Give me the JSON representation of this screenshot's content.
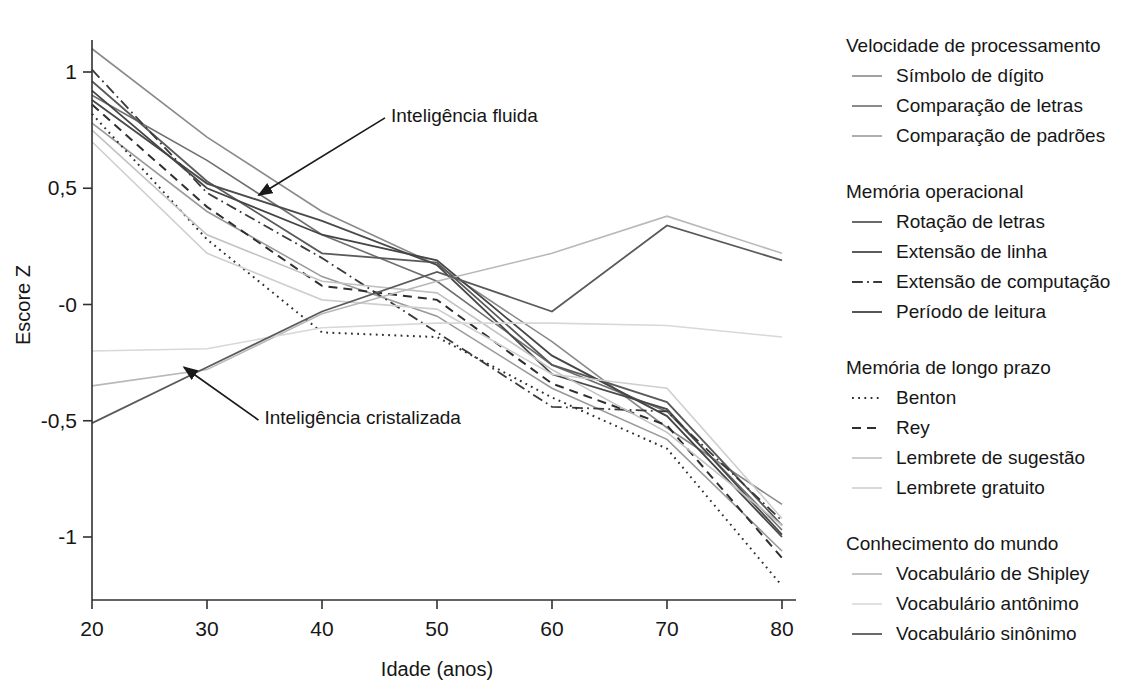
{
  "chart_data": {
    "type": "line",
    "title": "",
    "xlabel": "Idade (anos)",
    "ylabel": "Escore Z",
    "x": [
      20,
      30,
      40,
      50,
      60,
      70,
      80
    ],
    "xlim": [
      20,
      80
    ],
    "ylim": [
      -1.25,
      1.15
    ],
    "xticks": [
      "20",
      "30",
      "40",
      "50",
      "60",
      "70",
      "80"
    ],
    "yticks": [
      "1",
      "0,5",
      "-0",
      "-0,5",
      "-1"
    ],
    "ytick_values": [
      1,
      0.5,
      0,
      -0.5,
      -1
    ],
    "grid": false,
    "legend_position": "right",
    "annotations": [
      {
        "text": "Inteligência fluida",
        "x": 46,
        "y": 0.82,
        "arrow_to_x": 34.5,
        "arrow_to_y": 0.47
      },
      {
        "text": "Inteligência cristalizada",
        "x": 35,
        "y": -0.48,
        "arrow_to_x": 28,
        "arrow_to_y": -0.27
      }
    ],
    "groups": [
      {
        "name": "Velocidade de processamento",
        "series": [
          {
            "name": "Símbolo de dígito",
            "style": "solid",
            "color": "#8a8a8a",
            "width": 1.6,
            "values": [
              1.1,
              0.72,
              0.4,
              0.17,
              -0.16,
              -0.53,
              -0.86
            ]
          },
          {
            "name": "Comparação de letras",
            "style": "solid",
            "color": "#6e6e6e",
            "width": 1.6,
            "values": [
              0.9,
              0.62,
              0.3,
              0.1,
              -0.26,
              -0.46,
              -0.97
            ]
          },
          {
            "name": "Comparação de padrões",
            "style": "solid",
            "color": "#9a9a9a",
            "width": 1.6,
            "values": [
              0.78,
              0.4,
              0.12,
              -0.05,
              -0.36,
              -0.58,
              -1.06
            ]
          }
        ]
      },
      {
        "name": "Memória operacional",
        "series": [
          {
            "name": "Rotação de letras",
            "style": "solid",
            "color": "#5a5a5a",
            "width": 1.8,
            "values": [
              0.96,
              0.53,
              0.22,
              0.18,
              -0.26,
              -0.42,
              -0.95
            ]
          },
          {
            "name": "Extensão de linha",
            "style": "solid",
            "color": "#4a4a4a",
            "width": 1.8,
            "values": [
              0.88,
              0.52,
              0.36,
              0.17,
              -0.3,
              -0.45,
              -0.99
            ]
          },
          {
            "name": "Extensão de computação",
            "style": "dashdot",
            "color": "#3a3a3a",
            "width": 1.8,
            "values": [
              1.01,
              0.48,
              0.2,
              -0.12,
              -0.44,
              -0.46,
              -0.93
            ]
          },
          {
            "name": "Período de leitura",
            "style": "solid",
            "color": "#454545",
            "width": 1.8,
            "values": [
              0.92,
              0.5,
              0.3,
              0.19,
              -0.22,
              -0.48,
              -1.0
            ]
          }
        ]
      },
      {
        "name": "Memória de longo prazo",
        "series": [
          {
            "name": "Benton",
            "style": "dotted",
            "color": "#2e2e2e",
            "width": 2.0,
            "values": [
              0.82,
              0.28,
              -0.12,
              -0.14,
              -0.4,
              -0.62,
              -1.21
            ]
          },
          {
            "name": "Rey",
            "style": "dashed",
            "color": "#2e2e2e",
            "width": 2.0,
            "values": [
              0.86,
              0.42,
              0.08,
              0.02,
              -0.34,
              -0.52,
              -1.09
            ]
          },
          {
            "name": "Lembrete de sugestão",
            "style": "solid",
            "color": "#c2c2c2",
            "width": 1.6,
            "values": [
              0.75,
              0.3,
              0.1,
              0.05,
              -0.28,
              -0.55,
              -0.95
            ]
          },
          {
            "name": "Lembrete gratuito",
            "style": "solid",
            "color": "#cfcfcf",
            "width": 1.6,
            "values": [
              0.7,
              0.22,
              0.02,
              -0.02,
              -0.3,
              -0.36,
              -0.92
            ]
          }
        ]
      },
      {
        "name": "Conhecimento do mundo",
        "series": [
          {
            "name": "Vocabulário de Shipley",
            "style": "solid",
            "color": "#b8b8b8",
            "width": 1.6,
            "values": [
              -0.35,
              -0.28,
              -0.04,
              0.1,
              0.22,
              0.38,
              0.22
            ]
          },
          {
            "name": "Vocabulário antônimo",
            "style": "solid",
            "color": "#d8d8d8",
            "width": 1.6,
            "values": [
              -0.2,
              -0.19,
              -0.1,
              -0.08,
              -0.08,
              -0.09,
              -0.14
            ]
          },
          {
            "name": "Vocabulário sinônimo",
            "style": "solid",
            "color": "#5a5a5a",
            "width": 1.8,
            "values": [
              -0.51,
              -0.27,
              -0.03,
              0.14,
              -0.03,
              0.34,
              0.19
            ]
          }
        ]
      }
    ]
  },
  "legend": {
    "groups": [
      {
        "title": "Velocidade de processamento",
        "items": [
          {
            "label": "Símbolo de dígito"
          },
          {
            "label": "Comparação de letras"
          },
          {
            "label": "Comparação de padrões"
          }
        ]
      },
      {
        "title": "Memória operacional",
        "items": [
          {
            "label": "Rotação de letras"
          },
          {
            "label": "Extensão de linha"
          },
          {
            "label": "Extensão de computação"
          },
          {
            "label": "Período de leitura"
          }
        ]
      },
      {
        "title": "Memória de longo prazo",
        "items": [
          {
            "label": "Benton"
          },
          {
            "label": "Rey"
          },
          {
            "label": "Lembrete de sugestão"
          },
          {
            "label": "Lembrete gratuito"
          }
        ]
      },
      {
        "title": "Conhecimento do mundo",
        "items": [
          {
            "label": "Vocabulário de Shipley"
          },
          {
            "label": "Vocabulário antônimo"
          },
          {
            "label": "Vocabulário sinônimo"
          }
        ]
      }
    ]
  }
}
